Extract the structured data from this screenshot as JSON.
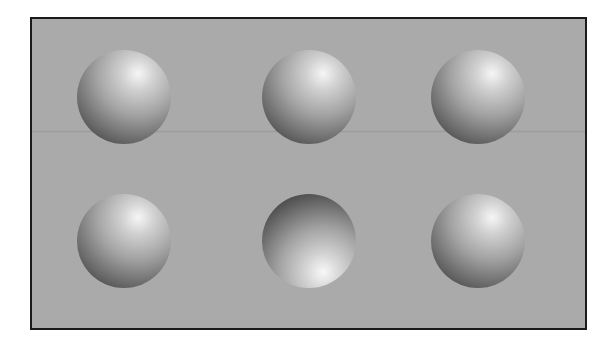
{
  "figure": {
    "background_color": "#aaaaaa",
    "border_color": "#1a1a1a",
    "rows": 2,
    "columns": 3,
    "spheres": [
      {
        "row": 1,
        "col": 1,
        "lighting": "top",
        "shading": "convex"
      },
      {
        "row": 1,
        "col": 2,
        "lighting": "top",
        "shading": "convex"
      },
      {
        "row": 1,
        "col": 3,
        "lighting": "top",
        "shading": "convex"
      },
      {
        "row": 2,
        "col": 1,
        "lighting": "top",
        "shading": "convex"
      },
      {
        "row": 2,
        "col": 2,
        "lighting": "bottom",
        "shading": "concave"
      },
      {
        "row": 2,
        "col": 3,
        "lighting": "top",
        "shading": "convex"
      }
    ]
  }
}
